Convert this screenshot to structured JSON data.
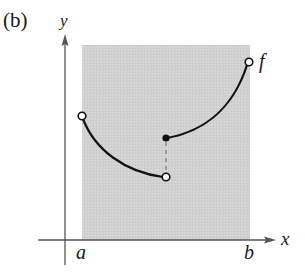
{
  "figure": {
    "panel_label": "(b)",
    "axes": {
      "x_label": "x",
      "y_label": "y"
    },
    "interval": {
      "left_label": "a",
      "right_label": "b"
    },
    "function_label": "f",
    "colors": {
      "shade": "#cfcfcf",
      "axis": "#555555",
      "curve": "#111111",
      "background": "#ffffff"
    }
  }
}
